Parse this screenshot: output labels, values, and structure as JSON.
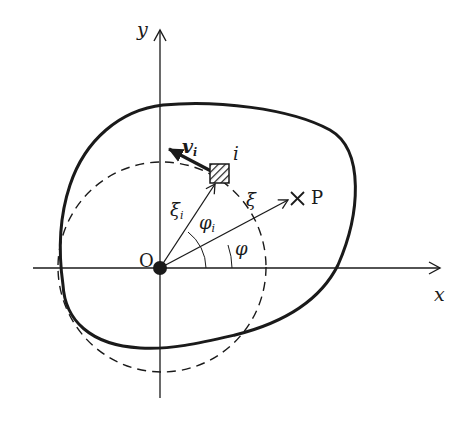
{
  "diagram": {
    "axes": {
      "x_label": "x",
      "y_label": "y",
      "origin_label": "O"
    },
    "labels": {
      "velocity": "v",
      "velocity_sub": "i",
      "element": "i",
      "xi_i": "ξ",
      "xi_i_sub": "i",
      "phi_i": "φ",
      "phi_i_sub": "i",
      "xi": "ξ",
      "phi": "φ",
      "point": "P",
      "point_marker": "×"
    },
    "colors": {
      "stroke": "#1a1a1a",
      "background": "#ffffff"
    }
  }
}
